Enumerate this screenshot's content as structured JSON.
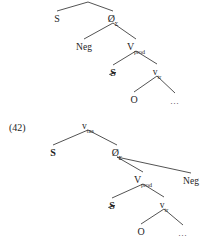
{
  "page": {
    "background_color": "#ffffff",
    "ink_color": "#1d1d1d",
    "width": 215,
    "height": 241
  },
  "figures": [
    {
      "id": "tree-top",
      "example_number": "",
      "truncated_at_top": true,
      "nodes": [
        {
          "id": "t-root",
          "label": "",
          "sub": "",
          "x": 88,
          "y": -4,
          "kind": "root-offscreen",
          "style": "plain"
        },
        {
          "id": "t-s1",
          "label": "S",
          "sub": "",
          "x": 57,
          "y": 17,
          "kind": "terminal",
          "style": "plain"
        },
        {
          "id": "t-sigma",
          "label": "Ø",
          "sub": "Σ",
          "x": 113,
          "y": 17,
          "kind": "nonterminal",
          "style": "plain"
        },
        {
          "id": "t-neg",
          "label": "Neg",
          "sub": "",
          "x": 84,
          "y": 45,
          "kind": "terminal",
          "style": "plain"
        },
        {
          "id": "t-vpred",
          "label": "V",
          "sub": "prod",
          "x": 136,
          "y": 45,
          "kind": "nonterminal",
          "style": "plain"
        },
        {
          "id": "t-s2",
          "label": "S",
          "sub": "",
          "x": 113,
          "y": 71,
          "kind": "terminal",
          "style": "struck"
        },
        {
          "id": "t-vtr",
          "label": "v",
          "sub": "tr",
          "x": 157,
          "y": 70,
          "kind": "nonterminal",
          "style": "plain"
        },
        {
          "id": "t-o",
          "label": "O",
          "sub": "",
          "x": 134,
          "y": 98,
          "kind": "terminal",
          "style": "plain"
        },
        {
          "id": "t-dots",
          "label": "…",
          "sub": "",
          "x": 175,
          "y": 99,
          "kind": "terminal",
          "style": "ellipsis"
        }
      ],
      "edges": [
        {
          "from": "t-root",
          "to": "t-s1"
        },
        {
          "from": "t-root",
          "to": "t-sigma"
        },
        {
          "from": "t-sigma",
          "to": "t-neg"
        },
        {
          "from": "t-sigma",
          "to": "t-vpred"
        },
        {
          "from": "t-vpred",
          "to": "t-s2"
        },
        {
          "from": "t-vpred",
          "to": "t-vtr"
        },
        {
          "from": "t-vtr",
          "to": "t-o"
        },
        {
          "from": "t-vtr",
          "to": "t-dots"
        }
      ]
    },
    {
      "id": "tree-bottom",
      "example_number": "(42)",
      "truncated_at_top": false,
      "nodes": [
        {
          "id": "b-root",
          "label": "v",
          "sub": "tns",
          "x": 88,
          "y": 124,
          "kind": "root",
          "style": "plain"
        },
        {
          "id": "b-s1",
          "label": "S",
          "sub": "",
          "x": 53,
          "y": 151,
          "kind": "terminal",
          "style": "bold"
        },
        {
          "id": "b-sigma",
          "label": "Ø",
          "sub": "Σ",
          "x": 117,
          "y": 151,
          "kind": "nonterminal",
          "style": "plain"
        },
        {
          "id": "b-vpred",
          "label": "V",
          "sub": "prod",
          "x": 143,
          "y": 178,
          "kind": "nonterminal",
          "style": "plain"
        },
        {
          "id": "b-neg",
          "label": "Neg",
          "sub": "",
          "x": 191,
          "y": 179,
          "kind": "terminal",
          "style": "plain"
        },
        {
          "id": "b-s2",
          "label": "S",
          "sub": "",
          "x": 112,
          "y": 204,
          "kind": "terminal",
          "style": "struck"
        },
        {
          "id": "b-vtr",
          "label": "v",
          "sub": "tr",
          "x": 164,
          "y": 203,
          "kind": "nonterminal",
          "style": "plain"
        },
        {
          "id": "b-o",
          "label": "O",
          "sub": "",
          "x": 141,
          "y": 230,
          "kind": "terminal",
          "style": "plain"
        },
        {
          "id": "b-dots",
          "label": "…",
          "sub": "",
          "x": 183,
          "y": 231,
          "kind": "terminal",
          "style": "ellipsis"
        }
      ],
      "edges": [
        {
          "from": "b-root",
          "to": "b-s1"
        },
        {
          "from": "b-root",
          "to": "b-sigma"
        },
        {
          "from": "b-sigma",
          "to": "b-vpred"
        },
        {
          "from": "b-sigma",
          "to": "b-neg"
        },
        {
          "from": "b-vpred",
          "to": "b-s2"
        },
        {
          "from": "b-vpred",
          "to": "b-vtr"
        },
        {
          "from": "b-vtr",
          "to": "b-o"
        },
        {
          "from": "b-vtr",
          "to": "b-dots"
        }
      ]
    }
  ]
}
